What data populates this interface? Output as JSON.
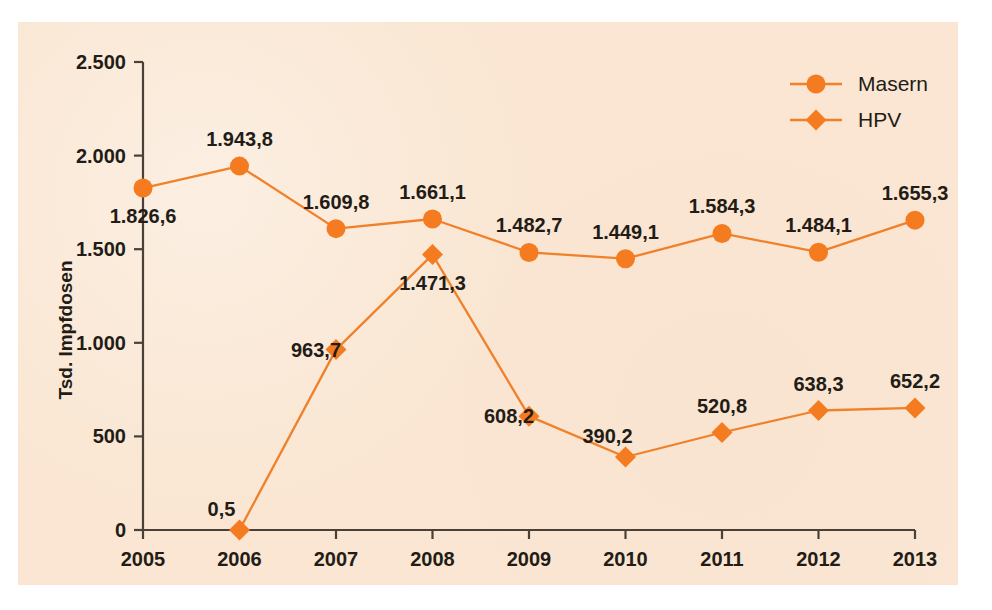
{
  "chart_data": {
    "type": "line",
    "title": "",
    "xlabel": "",
    "ylabel": "Tsd. Impfdosen",
    "categories": [
      "2005",
      "2006",
      "2007",
      "2008",
      "2009",
      "2010",
      "2011",
      "2012",
      "2013"
    ],
    "x": [
      2005,
      2006,
      2007,
      2008,
      2009,
      2010,
      2011,
      2012,
      2013
    ],
    "ylim": [
      0,
      2500
    ],
    "xlim": [
      2005,
      2013
    ],
    "yticks": [
      0,
      500,
      1000,
      1500,
      2000,
      2500
    ],
    "ytick_labels": [
      "0",
      "500",
      "1.000",
      "1.500",
      "2.000",
      "2.500"
    ],
    "xtick_labels": [
      "2005",
      "2006",
      "2007",
      "2008",
      "2009",
      "2010",
      "2011",
      "2012",
      "2013"
    ],
    "grid": false,
    "legend_position": "top-right",
    "number_format": "de-DE (comma decimal, dot thousands)",
    "series": [
      {
        "name": "Masern",
        "marker": "circle",
        "color": "#f47b1f",
        "values": [
          1826.6,
          1943.8,
          1609.8,
          1661.1,
          1482.7,
          1449.1,
          1584.3,
          1484.1,
          1655.3
        ],
        "labels": [
          "1.826,6",
          "1.943,8",
          "1.609,8",
          "1.661,1",
          "1.482,7",
          "1.449,1",
          "1.584,3",
          "1.484,1",
          "1.655,3"
        ],
        "label_positions": [
          "below",
          "above",
          "above",
          "above",
          "above",
          "above",
          "above",
          "above",
          "above"
        ]
      },
      {
        "name": "HPV",
        "marker": "diamond",
        "color": "#f47b1f",
        "values": [
          null,
          0.5,
          963.7,
          1471.3,
          608.2,
          390.2,
          520.8,
          638.3,
          652.2
        ],
        "labels": [
          null,
          "0,5",
          "963,7",
          "1.471,3",
          "608,2",
          "390,2",
          "520,8",
          "638,3",
          "652,2"
        ],
        "label_positions": [
          null,
          "above-left",
          "left",
          "below",
          "left",
          "above-left",
          "above",
          "above",
          "above"
        ]
      }
    ],
    "legend": [
      {
        "label": "Masern",
        "marker": "circle",
        "color": "#f47b1f"
      },
      {
        "label": "HPV",
        "marker": "diamond",
        "color": "#f47b1f"
      }
    ],
    "colors": {
      "accent": "#f47b1f",
      "line": "#f0812a",
      "panel_background": "#fae6d2",
      "text": "#231c16",
      "axis": "#4a4038",
      "page_background": "#ffffff"
    }
  }
}
